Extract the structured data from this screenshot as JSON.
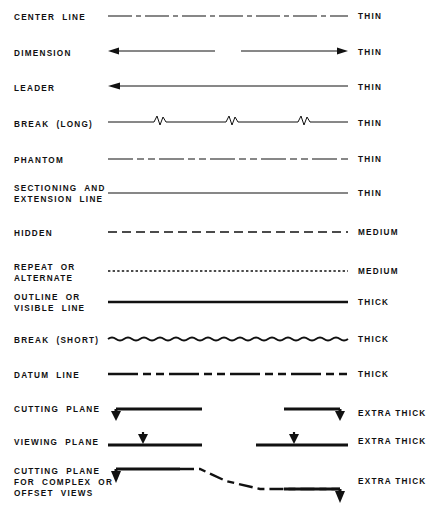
{
  "diagram": {
    "columns": {
      "name_header": "",
      "sample_header": "",
      "weight_header": ""
    },
    "rows": [
      {
        "name": "CENTER LINE",
        "name_lines": [
          "CENTER  LINE"
        ],
        "weight": "THIN",
        "pattern": "long-dash-short-dash",
        "stroke_width": 1.1,
        "bold_label": false
      },
      {
        "name": "DIMENSION",
        "name_lines": [
          "DIMENSION"
        ],
        "weight": "THIN",
        "pattern": "double-arrow-with-gap",
        "stroke_width": 1.1,
        "bold_label": false
      },
      {
        "name": "LEADER",
        "name_lines": [
          "LEADER"
        ],
        "weight": "THIN",
        "pattern": "single-arrow-left",
        "stroke_width": 1.1,
        "bold_label": false
      },
      {
        "name": "BREAK (LONG)",
        "name_lines": [
          "BREAK  (LONG)"
        ],
        "weight": "THIN",
        "pattern": "long-break-zigzag",
        "stroke_width": 1.1,
        "bold_label": false
      },
      {
        "name": "PHANTOM",
        "name_lines": [
          "PHANTOM"
        ],
        "weight": "THIN",
        "pattern": "long-dash-double-short-dash",
        "stroke_width": 1.1,
        "bold_label": false
      },
      {
        "name": "SECTIONING AND EXTENSION LINE",
        "name_lines": [
          "SECTIONING  AND",
          "EXTENSION  LINE"
        ],
        "weight": "THIN",
        "pattern": "continuous",
        "stroke_width": 1.1,
        "bold_label": false
      },
      {
        "name": "HIDDEN",
        "name_lines": [
          "HIDDEN"
        ],
        "weight": "MEDIUM",
        "pattern": "medium-dash",
        "stroke_width": 1.7,
        "bold_label": false
      },
      {
        "name": "REPEAT OR ALTERNATE",
        "name_lines": [
          "REPEAT  OR",
          "ALTERNATE"
        ],
        "weight": "MEDIUM",
        "pattern": "fine-dotted",
        "stroke_width": 1.7,
        "bold_label": true
      },
      {
        "name": "OUTLINE OR VISIBLE LINE",
        "name_lines": [
          "OUTLINE  OR",
          "VISIBLE  LINE"
        ],
        "weight": "THICK",
        "pattern": "continuous",
        "stroke_width": 2.3,
        "bold_label": false
      },
      {
        "name": "BREAK (SHORT)",
        "name_lines": [
          "BREAK  (SHORT)"
        ],
        "weight": "THICK",
        "pattern": "wavy",
        "stroke_width": 2.0,
        "bold_label": false
      },
      {
        "name": "DATUM LINE",
        "name_lines": [
          "DATUM  LINE"
        ],
        "weight": "THICK",
        "pattern": "long-dash-double-short-dash",
        "stroke_width": 2.3,
        "bold_label": false
      },
      {
        "name": "CUTTING PLANE",
        "name_lines": [
          "CUTTING  PLANE"
        ],
        "weight": "EXTRA THICK",
        "pattern": "cutting-plane-arrows",
        "stroke_width": 3.0,
        "bold_label": false
      },
      {
        "name": "VIEWING PLANE",
        "name_lines": [
          "VIEWING  PLANE"
        ],
        "weight": "EXTRA THICK",
        "pattern": "viewing-plane-arrows",
        "stroke_width": 3.0,
        "bold_label": false
      },
      {
        "name": "CUTTING PLANE FOR COMPLEX OR OFFSET VIEWS",
        "name_lines": [
          "CUTTING  PLANE",
          "FOR  COMPLEX  OR",
          "OFFSET  VIEWS"
        ],
        "weight": "EXTRA THICK",
        "pattern": "offset-cutting-plane",
        "stroke_width": 3.0,
        "bold_label": false
      }
    ],
    "colors": {
      "ink": "#111111",
      "paper": "#ffffff"
    }
  }
}
